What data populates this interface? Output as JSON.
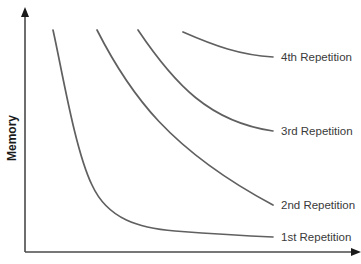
{
  "chart_data": {
    "type": "line",
    "title": "",
    "xlabel": "",
    "ylabel": "Memory",
    "grid": false,
    "legend": "inline labels at right end of each curve",
    "axes": {
      "x_ticks": [],
      "y_ticks": [],
      "arrows": true
    },
    "series": [
      {
        "name": "1st Repetition",
        "description": "steep decay flattening to a low plateau",
        "path": "M53,30 C62,70 75,150 92,185 C108,220 140,228 175,231 C215,234 250,236 273,237",
        "label_x": 281,
        "label_y": 241
      },
      {
        "name": "2nd Repetition",
        "description": "moderate decay",
        "path": "M97,30 C130,95 170,150 273,205",
        "label_x": 281,
        "label_y": 209
      },
      {
        "name": "3rd Repetition",
        "description": "slower decay",
        "path": "M138,30 C175,85 210,122 273,131",
        "label_x": 281,
        "label_y": 135
      },
      {
        "name": "4th Repetition",
        "description": "slowest decay, stays high",
        "path": "M183,32 C215,46 240,55 273,57",
        "label_x": 281,
        "label_y": 61
      }
    ]
  }
}
